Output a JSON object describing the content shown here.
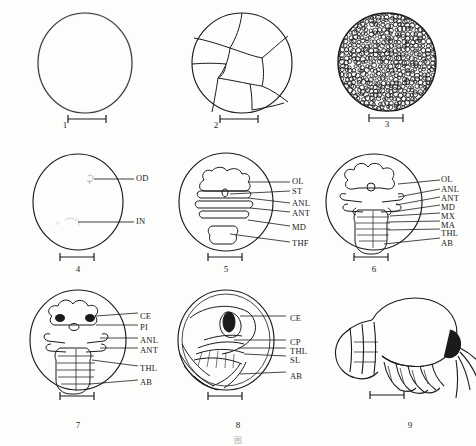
{
  "figure": {
    "panel_count": 9,
    "line_color": "#1b1b1b",
    "background_color": "#fdfdfc"
  },
  "panels": [
    {
      "number": "1",
      "stage": "uncleaved egg",
      "scalebar": true,
      "labels": []
    },
    {
      "number": "2",
      "stage": "cleavage stage",
      "scalebar": true,
      "labels": []
    },
    {
      "number": "3",
      "stage": "blastula",
      "scalebar": true,
      "labels": []
    },
    {
      "number": "4",
      "stage": "early differentiation",
      "scalebar": true,
      "labels": [
        "OD",
        "IN"
      ]
    },
    {
      "number": "5",
      "stage": "limb bud formation",
      "scalebar": true,
      "labels": [
        "OL",
        "ST",
        "ANL",
        "ANT",
        "MD",
        "THF"
      ]
    },
    {
      "number": "6",
      "stage": "segmentation",
      "scalebar": true,
      "labels": [
        "OL",
        "ANL",
        "ANT",
        "MD",
        "MX",
        "MA",
        "THL",
        "AB"
      ]
    },
    {
      "number": "7",
      "stage": "eye pigmentation",
      "scalebar": true,
      "labels": [
        "CE",
        "PI",
        "ANL",
        "ANT",
        "THL",
        "AB"
      ]
    },
    {
      "number": "8",
      "stage": "pre-hatching lateral view",
      "scalebar": true,
      "labels": [
        "CE",
        "CP",
        "THL",
        "SL",
        "AB"
      ]
    },
    {
      "number": "9",
      "stage": "hatched larva",
      "scalebar": true,
      "labels": []
    }
  ],
  "caption": "图"
}
